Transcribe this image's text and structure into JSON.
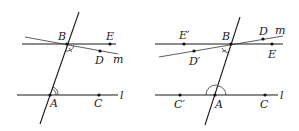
{
  "figures": [
    {
      "id": "left",
      "labels": {
        "B": "B",
        "E": "E",
        "D": "D",
        "m": "m",
        "A": "A",
        "C": "C",
        "l": "l"
      },
      "angle_marks": {
        "at_B": "single arc with tick (angle DBA)",
        "at_A": "double arc (angle BAC)"
      }
    },
    {
      "id": "right",
      "labels": {
        "B": "B",
        "E": "E",
        "E_prime": "E′",
        "D": "D",
        "D_prime": "D′",
        "m": "m",
        "A": "A",
        "C": "C",
        "C_prime": "C′",
        "l": "l"
      },
      "angle_marks": {
        "at_B": "single arc with tick (angle D′BA)",
        "at_A": "two single arcs (angles BAC and BAC′)"
      }
    }
  ],
  "colors": {
    "stroke": "#1a1a1a",
    "background": "#ffffff"
  }
}
